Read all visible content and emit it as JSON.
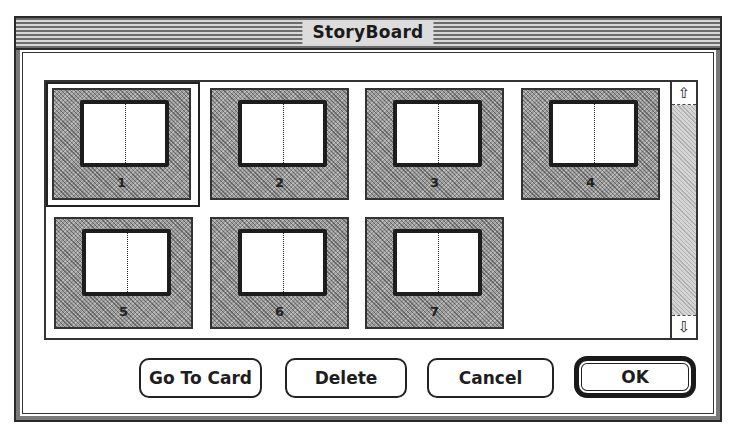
{
  "window": {
    "title": "StoryBoard"
  },
  "storyboard": {
    "selected_card": "1",
    "cards": [
      {
        "number": "1",
        "selected": true
      },
      {
        "number": "2",
        "selected": false
      },
      {
        "number": "3",
        "selected": false
      },
      {
        "number": "4",
        "selected": false
      },
      {
        "number": "5",
        "selected": false
      },
      {
        "number": "6",
        "selected": false
      },
      {
        "number": "7",
        "selected": false
      }
    ],
    "scrollbar": {
      "up_arrow_icon": "⇧",
      "down_arrow_icon": "⇩"
    }
  },
  "buttons": {
    "go_to_card": "Go To Card",
    "delete": "Delete",
    "cancel": "Cancel",
    "ok": "OK",
    "default_button": "OK"
  },
  "colors": {
    "frame": "#2a2a2a",
    "dither_gray": "#9a9a9a",
    "background": "#ffffff"
  }
}
